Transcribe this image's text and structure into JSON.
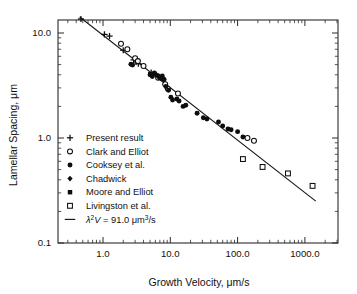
{
  "chart_data": {
    "type": "scatter",
    "title": "",
    "xlabel": "Growth Velocity, μm/s",
    "ylabel": "Lamellar Spacing, μm",
    "xscale": "log",
    "yscale": "log",
    "xlim": [
      0.25,
      2000
    ],
    "ylim": [
      0.1,
      20
    ],
    "xticks": [
      "1.0",
      "10.0",
      "100.0",
      "1000.0"
    ],
    "xtick_values": [
      1,
      10,
      100,
      1000
    ],
    "yticks": [
      "10.0",
      "1.0",
      "0.1"
    ],
    "ytick_values": [
      10,
      1,
      0.1
    ],
    "grid": false,
    "legend_position": "lower-left inside axes",
    "annotation": "λ²V = 91.0 μm³/s",
    "fit": {
      "label": "λ²V = 91.0 μm³/s",
      "constant": 91.0,
      "exponent": -0.5,
      "x_start": 0.45,
      "x_end": 1450
    },
    "series": [
      {
        "name": "Present result",
        "marker": "plus",
        "points": [
          [
            0.47,
            13.6
          ],
          [
            1.05,
            9.7
          ],
          [
            1.25,
            9.35
          ],
          [
            2.0,
            6.85
          ],
          [
            2.85,
            5.55
          ],
          [
            3.1,
            5.3
          ],
          [
            3.35,
            5.1
          ],
          [
            5.2,
            4.2
          ],
          [
            5.6,
            4.05
          ]
        ]
      },
      {
        "name": "Clark and Elliot",
        "marker": "open-circle",
        "points": [
          [
            1.85,
            7.9
          ],
          [
            2.3,
            7.0
          ],
          [
            3.0,
            5.75
          ],
          [
            3.3,
            5.4
          ],
          [
            4.0,
            4.85
          ],
          [
            6.6,
            3.75
          ],
          [
            8.4,
            3.25
          ],
          [
            9.2,
            2.95
          ],
          [
            13.0,
            2.65
          ],
          [
            140,
            1.0
          ],
          [
            175,
            0.94
          ]
        ]
      },
      {
        "name": "Cooksey et al.",
        "marker": "filled-circle",
        "points": [
          [
            2.6,
            5.05
          ],
          [
            2.75,
            4.95
          ],
          [
            5.0,
            4.0
          ],
          [
            5.4,
            3.85
          ],
          [
            5.8,
            4.15
          ],
          [
            6.4,
            3.95
          ],
          [
            6.9,
            3.75
          ],
          [
            7.6,
            3.9
          ],
          [
            8.1,
            3.6
          ],
          [
            8.6,
            3.1
          ],
          [
            9.4,
            2.85
          ],
          [
            10.2,
            2.45
          ],
          [
            10.8,
            2.3
          ],
          [
            12.5,
            2.35
          ],
          [
            13.5,
            2.25
          ],
          [
            15.5,
            2.0
          ],
          [
            17.0,
            2.05
          ],
          [
            25.0,
            1.72
          ],
          [
            31.0,
            1.56
          ],
          [
            35.0,
            1.52
          ],
          [
            52.0,
            1.42
          ],
          [
            60.0,
            1.3
          ],
          [
            72.0,
            1.22
          ],
          [
            80.0,
            1.2
          ],
          [
            100.0,
            1.15
          ],
          [
            120.0,
            1.02
          ]
        ]
      },
      {
        "name": "Chadwick",
        "marker": "filled-diamond",
        "points": [
          [
            6.2,
            4.0
          ],
          [
            6.8,
            3.85
          ],
          [
            7.3,
            3.7
          ],
          [
            7.9,
            3.6
          ]
        ]
      },
      {
        "name": "Moore and Elliot",
        "marker": "filled-square",
        "points": [
          [
            7.1,
            3.8
          ],
          [
            7.7,
            3.65
          ]
        ]
      },
      {
        "name": "Livingston et al.",
        "marker": "open-square",
        "points": [
          [
            120,
            0.63
          ],
          [
            235,
            0.53
          ],
          [
            560,
            0.46
          ],
          [
            1300,
            0.35
          ]
        ]
      }
    ]
  },
  "legend": {
    "entries": [
      {
        "label": "Present result",
        "marker": "plus"
      },
      {
        "label": "Clark and Elliot",
        "marker": "open-circle"
      },
      {
        "label": "Cooksey et al.",
        "marker": "filled-circle"
      },
      {
        "label": "Chadwick",
        "marker": "filled-diamond"
      },
      {
        "label": "Moore and Elliot",
        "marker": "filled-square"
      },
      {
        "label": "Livingston et al.",
        "marker": "open-square"
      },
      {
        "label": "λ²V = 91.0 μm³/s",
        "marker": "line"
      }
    ],
    "equation": {
      "lambda": "λ",
      "exponent": "2",
      "velocity": "V",
      "equals": " = 91.0 ",
      "unit_mu": "μm",
      "unit_exp": "3",
      "unit_tail": "/s"
    }
  },
  "axes": {
    "x_title": "Growth Velocity, μm/s",
    "y_title": "Lamellar Spacing, μm",
    "x_tick_labels": [
      "1.0",
      "10.0",
      "100.0",
      "1000.0"
    ],
    "y_tick_labels": [
      "10.0",
      "1.0",
      "0.1"
    ]
  },
  "colors": {
    "marker": "#0d0d0d",
    "frame": "#2b2b2b",
    "line": "#1a1a1a",
    "background": "#ffffff"
  }
}
